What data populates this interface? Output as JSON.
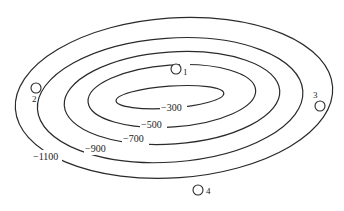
{
  "diagram": {
    "type": "contour-map",
    "contours": [
      {
        "value": -1100,
        "label": "−1100",
        "cx": 174,
        "cy": 98,
        "rx": 159,
        "ry": 80,
        "label_x": 45,
        "label_y": 160
      },
      {
        "value": -900,
        "label": "−900",
        "cx": 170,
        "cy": 100,
        "rx": 133,
        "ry": 62,
        "label_x": 96,
        "label_y": 152
      },
      {
        "value": -700,
        "label": "−700",
        "cx": 172,
        "cy": 98,
        "rx": 108,
        "ry": 46,
        "label_x": 134,
        "label_y": 142
      },
      {
        "value": -500,
        "label": "−500",
        "cx": 172,
        "cy": 96,
        "rx": 84,
        "ry": 31,
        "label_x": 152,
        "label_y": 128
      },
      {
        "value": -300,
        "label": "−300",
        "cx": 170,
        "cy": 97,
        "rx": 54,
        "ry": 11,
        "label_x": 173,
        "label_y": 111
      }
    ],
    "points": [
      {
        "id": "1",
        "label": "1",
        "x": 176,
        "y": 69,
        "label_x": 186,
        "label_y": 74
      },
      {
        "id": "2",
        "label": "2",
        "x": 36,
        "y": 88,
        "label_x": 33,
        "label_y": 102
      },
      {
        "id": "3",
        "label": "3",
        "x": 320,
        "y": 106,
        "label_x": 314,
        "label_y": 98
      },
      {
        "id": "4",
        "label": "4",
        "x": 198,
        "y": 190,
        "label_x": 206,
        "label_y": 194
      }
    ],
    "line_color": "#2a2a2a",
    "background": "#ffffff"
  }
}
